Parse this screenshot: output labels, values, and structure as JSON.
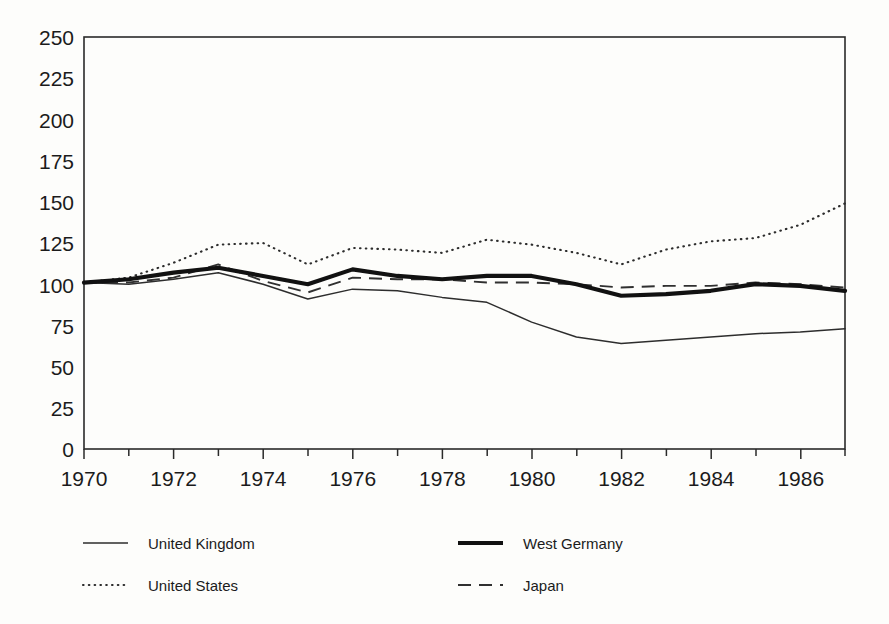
{
  "chart_data": {
    "type": "line",
    "title": "",
    "subtitle": "",
    "xlabel": "",
    "ylabel": "",
    "xlim": [
      1970,
      1987
    ],
    "ylim": [
      0,
      250
    ],
    "grid": false,
    "legend_position": "bottom",
    "x": [
      1970,
      1971,
      1972,
      1973,
      1974,
      1975,
      1976,
      1977,
      1978,
      1979,
      1980,
      1981,
      1982,
      1983,
      1984,
      1985,
      1986,
      1987
    ],
    "x_tick_labels": [
      "1970",
      "1972",
      "1974",
      "1976",
      "1978",
      "1980",
      "1982",
      "1984",
      "1986"
    ],
    "x_tick_values": [
      1970,
      1972,
      1974,
      1976,
      1978,
      1980,
      1982,
      1984,
      1986
    ],
    "x_minor_ticks": [
      1971,
      1973,
      1975,
      1977,
      1979,
      1981,
      1983,
      1985,
      1987
    ],
    "y_tick_labels": [
      "0",
      "25",
      "50",
      "75",
      "100",
      "125",
      "150",
      "175",
      "200",
      "225",
      "250"
    ],
    "y_tick_values": [
      0,
      25,
      50,
      75,
      100,
      125,
      150,
      175,
      200,
      225,
      250
    ],
    "series": [
      {
        "name": "United Kingdom",
        "style": "thin-solid",
        "color": "#2d2d2d",
        "values": [
          101,
          100,
          103,
          107,
          100,
          91,
          97,
          96,
          92,
          89,
          77,
          68,
          64,
          66,
          68,
          70,
          71,
          73
        ]
      },
      {
        "name": "United States",
        "style": "dotted",
        "color": "#2d2d2d",
        "values": [
          101,
          104,
          113,
          124,
          125,
          112,
          122,
          121,
          119,
          127,
          124,
          119,
          112,
          121,
          126,
          128,
          136,
          149
        ]
      },
      {
        "name": "West Germany",
        "style": "thick-solid",
        "color": "#111111",
        "values": [
          101,
          103,
          107,
          110,
          105,
          100,
          109,
          105,
          103,
          105,
          105,
          100,
          93,
          94,
          96,
          100,
          99,
          96
        ]
      },
      {
        "name": "Japan",
        "style": "dashed",
        "color": "#303030",
        "values": [
          101,
          101,
          104,
          112,
          102,
          95,
          104,
          103,
          103,
          101,
          101,
          100,
          98,
          99,
          99,
          101,
          100,
          98
        ]
      }
    ]
  },
  "legend": {
    "entries": [
      {
        "label": "United Kingdom",
        "swatch": "thin-solid-line-swatch"
      },
      {
        "label": "West Germany",
        "swatch": "thick-solid-line-swatch"
      },
      {
        "label": "United States",
        "swatch": "dotted-line-swatch"
      },
      {
        "label": "Japan",
        "swatch": "dashed-line-swatch"
      }
    ]
  },
  "colors": {
    "background": "#fdfdfb",
    "axis": "#2a2a2a",
    "text": "#1b1b1b"
  }
}
